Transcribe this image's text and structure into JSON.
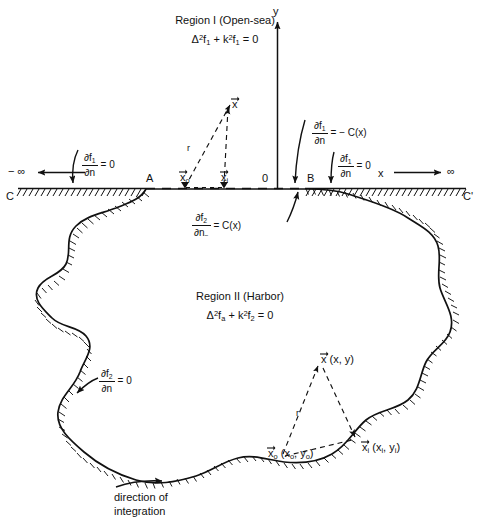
{
  "figure": {
    "regions": {
      "region1": {
        "name": "Region I (Open-sea)",
        "equation_prefix": "Δ",
        "equation": "Δ²f₁ + k²f₁ = 0",
        "eq_parts": {
          "delta": "Δ",
          "exp2": "2",
          "f1a": "f",
          "sub1a": "1",
          "plus": "+",
          "k": "k",
          "f1b": "f",
          "sub1b": "1",
          "equals": "= 0"
        }
      },
      "region2": {
        "name": "Region II (Harbor)",
        "equation": "Δ²f_a + k²f₂ = 0",
        "eq_parts": {
          "delta": "Δ",
          "exp2": "2",
          "fa": "f",
          "suba": "a",
          "plus": "+",
          "k": "k",
          "f2": "f",
          "sub2": "2",
          "equals": "= 0"
        }
      }
    },
    "axes": {
      "y_label": "y",
      "x_label_right": "x",
      "x_label_left_arrowed": "x",
      "origin_label": "0",
      "minus_infinity": "− ∞",
      "plus_infinity": "∞"
    },
    "coast_points": {
      "left_point": "A",
      "right_point": "B",
      "left_contour": "C",
      "right_contour": "C'"
    },
    "boundary_conditions": {
      "open_sea_left": {
        "numerator_d": "∂f",
        "numerator_sub": "1",
        "denominator": "∂n",
        "rhs": "= 0"
      },
      "open_sea_right": {
        "numerator_d": "∂f",
        "numerator_sub": "1",
        "denominator": "∂n",
        "rhs": "= 0"
      },
      "interface_upper": {
        "numerator_d": "∂f",
        "numerator_sub": "1",
        "denominator": "∂n",
        "rhs": "= − C(x)"
      },
      "interface_lower": {
        "numerator_d": "∂f",
        "numerator_sub": "2",
        "denominator_d": "∂n",
        "denominator_sub": "−",
        "rhs": "= C(x)"
      },
      "harbor_wall": {
        "numerator_d": "∂f",
        "numerator_sub": "2",
        "denominator": "∂n",
        "rhs": "= 0"
      }
    },
    "vectors_upper": {
      "x": "x",
      "x_o": "x",
      "x_o_sub": "o",
      "x_i": "x",
      "x_i_sub": "i",
      "r": "r"
    },
    "vectors_lower": {
      "x_head": "x",
      "x_coords": "(x, y)",
      "x_o_head": "x",
      "x_o_sub": "o",
      "x_o_coords": "(x",
      "x_o_coords_sub1": "o",
      "x_o_coords_mid": ", y",
      "x_o_coords_sub2": "o",
      "x_o_coords_end": ")",
      "x_i_head": "x",
      "x_i_sub": "i",
      "x_i_coords": "(x",
      "x_i_coords_sub1": "i",
      "x_i_coords_mid": ", y",
      "x_i_coords_sub2": "i",
      "x_i_coords_end": ")",
      "r": "r"
    },
    "caption": {
      "line1": "direction of",
      "line2": "integration"
    },
    "colors": {
      "ink": "#111111",
      "background": "#ffffff"
    }
  }
}
